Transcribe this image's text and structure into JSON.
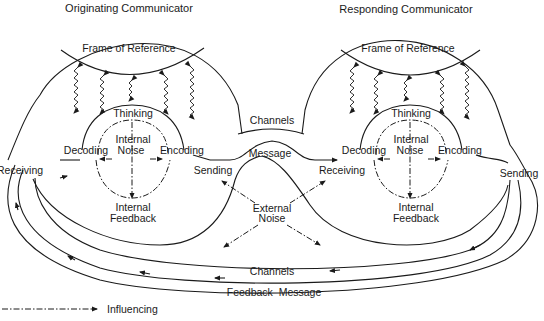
{
  "diagram": {
    "type": "communication-model",
    "originating": {
      "title": "Originating Communicator",
      "frame": "Frame of Reference",
      "thinking": "Thinking",
      "internal_noise_1": "Internal",
      "internal_noise_2": "Noise",
      "decoding": "Decoding",
      "encoding": "Encoding",
      "internal_feedback_1": "Internal",
      "internal_feedback_2": "Feedback",
      "receiving": "Receiving",
      "sending": "Sending"
    },
    "responding": {
      "title": "Responding Communicator",
      "frame": "Frame of Reference",
      "thinking": "Thinking",
      "internal_noise_1": "Internal",
      "internal_noise_2": "Noise",
      "decoding": "Decoding",
      "encoding": "Encoding",
      "internal_feedback_1": "Internal",
      "internal_feedback_2": "Feedback",
      "receiving": "Receiving",
      "sending": "Sending"
    },
    "center": {
      "channels": "Channels",
      "message": "Message",
      "external_noise_1": "External",
      "external_noise_2": "Noise"
    },
    "bottom": {
      "channels": "Channels",
      "feedback_message": "Feedback  Message"
    },
    "legend": {
      "influencing": "Influencing"
    }
  }
}
